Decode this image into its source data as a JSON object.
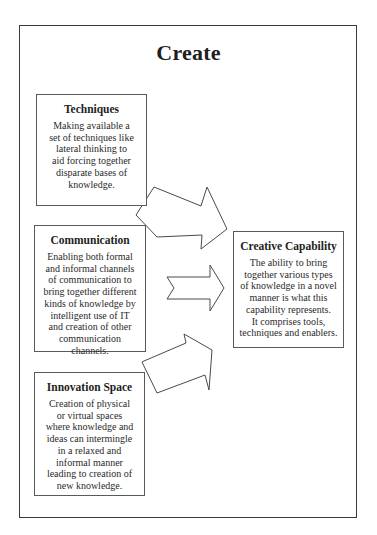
{
  "diagram": {
    "title": "Create",
    "sources": [
      {
        "id": "techniques",
        "heading": "Techniques",
        "lines": [
          "Making available a",
          "set of techniques like",
          "lateral thinking to",
          "aid forcing together",
          "disparate bases of",
          "knowledge."
        ]
      },
      {
        "id": "communication",
        "heading": "Communication",
        "lines": [
          "Enabling both formal",
          "and informal channels",
          "of communication to",
          "bring together different",
          "kinds of knowledge by",
          "intelligent use of IT",
          "and creation of other",
          "communication",
          "channels."
        ]
      },
      {
        "id": "innovation-space",
        "heading": "Innovation Space",
        "lines": [
          "Creation of physical",
          "or virtual spaces",
          "where knowledge and",
          "ideas can intermingle",
          "in a relaxed and",
          "informal manner",
          "leading to creation of",
          "new knowledge."
        ]
      }
    ],
    "target": {
      "id": "creative-capability",
      "heading": "Creative Capability",
      "lines": [
        "The ability to bring",
        "together various types",
        "of knowledge in a novel",
        "manner is what this",
        "capability represents.",
        "It comprises tools,",
        "techniques and enablers."
      ]
    },
    "arrows": [
      {
        "from": "Techniques",
        "to": "Creative Capability"
      },
      {
        "from": "Communication",
        "to": "Creative Capability"
      },
      {
        "from": "Innovation Space",
        "to": "Creative Capability"
      }
    ]
  }
}
